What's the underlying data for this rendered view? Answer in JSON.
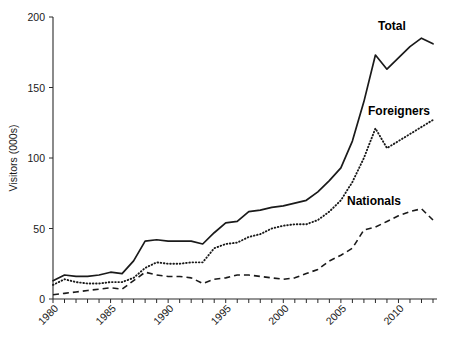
{
  "chart_data": {
    "type": "line",
    "title": "",
    "xlabel": "",
    "ylabel": "Visitors (000s)",
    "ylim": [
      0,
      200
    ],
    "yticks": [
      0,
      50,
      100,
      150,
      200
    ],
    "ytick_labels": [
      "0",
      "50",
      "100",
      "150",
      "200"
    ],
    "xlim": [
      1980,
      2013
    ],
    "xticks": [
      1980,
      1981,
      1982,
      1983,
      1984,
      1985,
      1986,
      1987,
      1988,
      1989,
      1990,
      1991,
      1992,
      1993,
      1994,
      1995,
      1996,
      1997,
      1998,
      1999,
      2000,
      2001,
      2002,
      2003,
      2004,
      2005,
      2006,
      2007,
      2008,
      2009,
      2010,
      2011,
      2012,
      2013
    ],
    "xtick_labels_shown": [
      "1980",
      "1985",
      "1990",
      "1995",
      "2000",
      "2005",
      "2010"
    ],
    "grid": false,
    "legend_position": "inline-right",
    "x": [
      1980,
      1981,
      1982,
      1983,
      1984,
      1985,
      1986,
      1987,
      1988,
      1989,
      1990,
      1991,
      1992,
      1993,
      1994,
      1995,
      1996,
      1997,
      1998,
      1999,
      2000,
      2001,
      2002,
      2003,
      2004,
      2005,
      2006,
      2007,
      2008,
      2009,
      2010,
      2011,
      2012,
      2013
    ],
    "series": [
      {
        "name": "Total",
        "style": "solid",
        "label": "Total",
        "values": [
          13,
          17,
          16,
          16,
          17,
          19,
          18,
          27,
          41,
          42,
          41,
          41,
          41,
          39,
          47,
          54,
          55,
          62,
          63,
          65,
          66,
          68,
          70,
          76,
          84,
          93,
          112,
          140,
          173,
          163,
          171,
          179,
          185,
          181
        ]
      },
      {
        "name": "Foreigners",
        "style": "dotted",
        "label": "Foreigners",
        "values": [
          10,
          14,
          12,
          11,
          11,
          12,
          12,
          15,
          22,
          26,
          25,
          25,
          26,
          26,
          36,
          39,
          40,
          44,
          46,
          50,
          52,
          53,
          53,
          56,
          62,
          70,
          83,
          100,
          121,
          107,
          112,
          117,
          122,
          127
        ]
      },
      {
        "name": "Nationals",
        "style": "dashed",
        "label": "Nationals",
        "values": [
          3,
          4,
          5,
          6,
          7,
          8,
          7,
          13,
          19,
          17,
          16,
          16,
          15,
          11,
          14,
          15,
          17,
          17,
          16,
          15,
          14,
          15,
          18,
          21,
          27,
          31,
          36,
          49,
          51,
          55,
          59,
          62,
          64,
          56
        ]
      }
    ]
  },
  "axes": {
    "y_title": "Visitors (000s)"
  }
}
